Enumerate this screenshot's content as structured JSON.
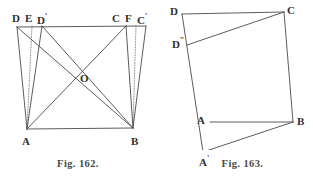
{
  "page": {
    "background_color": "#ffffff",
    "ink_color": "#4a4a4a",
    "label_color": "#303030",
    "width": 313,
    "height": 181
  },
  "figures": [
    {
      "id": "fig-162",
      "caption": "Fig. 162.",
      "type": "geometric-diagram",
      "description": "Quadrilateral ABCD with diagonals meeting at O, plus dotted perpendiculars and auxiliary points D, E, D' on top-left and C, F, C' on top-right.",
      "vertices": {
        "A": {
          "x": 27,
          "y": 129
        },
        "B": {
          "x": 133,
          "y": 128
        },
        "C": {
          "x": 126,
          "y": 26
        },
        "D": {
          "x": 17,
          "y": 27
        },
        "O": {
          "x": 78,
          "y": 79
        },
        "E": {
          "x": 32,
          "y": 26
        },
        "Dp": {
          "x": 42,
          "y": 26
        },
        "F": {
          "x": 136,
          "y": 26
        },
        "Cp": {
          "x": 146,
          "y": 26
        }
      },
      "labels": [
        {
          "key": "D",
          "text": "D",
          "prime": "",
          "x": 12,
          "y": 13
        },
        {
          "key": "E",
          "text": "E",
          "prime": "",
          "x": 25,
          "y": 13
        },
        {
          "key": "Dp",
          "text": "D",
          "prime": "'",
          "x": 37,
          "y": 13
        },
        {
          "key": "C",
          "text": "C",
          "prime": "",
          "x": 112,
          "y": 13
        },
        {
          "key": "F",
          "text": "F",
          "prime": "",
          "x": 125,
          "y": 13
        },
        {
          "key": "Cp",
          "text": "C",
          "prime": "'",
          "x": 137,
          "y": 13
        },
        {
          "key": "O",
          "text": "O",
          "prime": "",
          "x": 80,
          "y": 73
        },
        {
          "key": "A",
          "text": "A",
          "prime": "",
          "x": 22,
          "y": 136
        },
        {
          "key": "B",
          "text": "B",
          "prime": "",
          "x": 131,
          "y": 136
        }
      ],
      "solid_segments": [
        {
          "name": "top-edge-D-Cp",
          "from": "D",
          "to": "Cp"
        },
        {
          "name": "side-D-A",
          "from": "D",
          "to": "A"
        },
        {
          "name": "side-Dp-A",
          "from": "Dp",
          "to": "A"
        },
        {
          "name": "side-C-B",
          "from": "C",
          "to": "B"
        },
        {
          "name": "side-Cp-B",
          "from": "Cp",
          "to": "B"
        },
        {
          "name": "bottom-A-B",
          "from": "A",
          "to": "B"
        },
        {
          "name": "diagonal-A-C",
          "from": "A",
          "to": "C"
        },
        {
          "name": "diagonal-D-B",
          "from": "D",
          "to": "B"
        },
        {
          "name": "diagonal-Dp-B",
          "from": "Dp",
          "to": "B"
        }
      ],
      "dotted_segments": [
        {
          "name": "perpendicular-E-A",
          "from": "E",
          "to": "A"
        },
        {
          "name": "perpendicular-F-B",
          "from": "F",
          "to": "B"
        }
      ]
    },
    {
      "id": "fig-163",
      "caption": "Fig. 163.",
      "type": "geometric-diagram",
      "description": "Tilted quadrilateral ABCD with extra points A' below A and D'' below D, forming a second overlapping quadrilateral A'BCD''.",
      "vertices": {
        "D": {
          "x": 22,
          "y": 14
        },
        "C": {
          "x": 124,
          "y": 12
        },
        "Dpp": {
          "x": 27,
          "y": 45
        },
        "A": {
          "x": 50,
          "y": 122
        },
        "B": {
          "x": 133,
          "y": 122
        },
        "Ap": {
          "x": 43,
          "y": 152
        }
      },
      "labels": [
        {
          "key": "D",
          "text": "D",
          "prime": "",
          "x": 10,
          "y": 6
        },
        {
          "key": "C",
          "text": "C",
          "prime": "",
          "x": 127,
          "y": 5
        },
        {
          "key": "Dpp",
          "text": "D",
          "prime": "''",
          "x": 12,
          "y": 37
        },
        {
          "key": "A",
          "text": "A",
          "prime": "",
          "x": 37,
          "y": 115
        },
        {
          "key": "B",
          "text": "B",
          "prime": "",
          "x": 137,
          "y": 116
        },
        {
          "key": "Ap",
          "text": "A",
          "prime": "'",
          "x": 39,
          "y": 155
        }
      ],
      "solid_segments": [
        {
          "name": "edge-D-C",
          "from": "D",
          "to": "C"
        },
        {
          "name": "edge-D-Ap",
          "from": "D",
          "to": "Ap"
        },
        {
          "name": "edge-Dpp-C",
          "from": "Dpp",
          "to": "C"
        },
        {
          "name": "edge-C-B",
          "from": "C",
          "to": "B"
        },
        {
          "name": "edge-A-B",
          "from": "A",
          "to": "B"
        },
        {
          "name": "edge-Ap-B",
          "from": "Ap",
          "to": "B"
        }
      ],
      "dotted_segments": []
    }
  ]
}
